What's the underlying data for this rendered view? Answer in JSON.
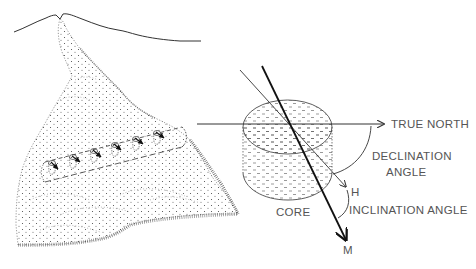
{
  "figure": {
    "colors": {
      "ink": "#222222",
      "label": "#555555",
      "background": "#ffffff"
    }
  },
  "labels": {
    "true_north": "TRUE NORTH",
    "declination_line1": "DECLINATION",
    "declination_line2": "ANGLE",
    "h": "H",
    "inclination": "INCLINATION ANGLE",
    "core": "CORE",
    "m": "M"
  },
  "elements": {
    "volcano_skyline": "mountain outline with summit vent",
    "lava_flow": "stippled lava flow descending from vent",
    "sample_cores": {
      "count": 6,
      "note": "drilled cores with magnetization arrows along a dashed sampling line"
    },
    "core_cylinder": "enlarged stippled core cylinder",
    "vectors": [
      "TRUE NORTH (horizontal)",
      "H (horizontal projection)",
      "M (magnetization, bold)"
    ]
  }
}
